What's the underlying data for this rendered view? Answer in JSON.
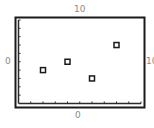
{
  "chart_data": {
    "type": "scatter",
    "title": "",
    "xlabel": "",
    "ylabel": "",
    "xlim": [
      0,
      10
    ],
    "ylim": [
      0,
      10
    ],
    "grid": false,
    "legend": null,
    "marker": "square",
    "points": [
      {
        "x": 2,
        "y": 4
      },
      {
        "x": 4,
        "y": 5
      },
      {
        "x": 6,
        "y": 3
      },
      {
        "x": 8,
        "y": 7
      }
    ],
    "x_ticks": 10,
    "y_ticks": 10,
    "annotations": {
      "top": "10",
      "left": "0",
      "right": "10",
      "bottom": "0"
    }
  },
  "colors": {
    "frame": "#1a1a1a",
    "axis": "#2a2a2a",
    "marker": "#1a1a1a",
    "label": "#8a8a8a"
  }
}
